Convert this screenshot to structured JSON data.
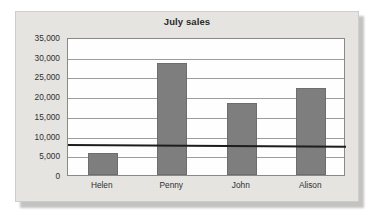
{
  "chart_data": {
    "type": "bar",
    "title": "July sales",
    "xlabel": "",
    "ylabel": "",
    "categories": [
      "Helen",
      "Penny",
      "John",
      "Alison"
    ],
    "values": [
      5600,
      28400,
      18300,
      22100
    ],
    "series": [
      {
        "name": "July sales",
        "values": [
          5600,
          28400,
          18300,
          22100
        ]
      }
    ],
    "ylim": [
      0,
      35000
    ],
    "ytick_values": [
      0,
      5000,
      10000,
      15000,
      20000,
      25000,
      30000,
      35000
    ],
    "ytick_labels": [
      "0",
      "5,000",
      "10,000",
      "15,000",
      "20,000",
      "25,000",
      "30,000",
      "35,000"
    ],
    "grid": true,
    "legend": false,
    "legend_position": "none",
    "bar_color": "#7f7f7f",
    "plot_background": "#ffffff",
    "panel_background": "#e6e5e2",
    "annotations": [
      {
        "name": "threshold-line",
        "type": "horizontal-rule",
        "value": 8300,
        "color": "#1e1e1e"
      }
    ]
  }
}
